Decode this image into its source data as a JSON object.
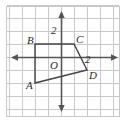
{
  "figure": {
    "kind": "coordinate-plane-quadrilateral",
    "width": 126,
    "height": 123,
    "background": "#ffffff",
    "border_color": "#c8c8c8",
    "grid_color": "#c9c9c9",
    "axis_color": "#555555",
    "shape_color": "#444444",
    "text_color": "#2b2b2b"
  },
  "grid": {
    "spacing_px": 13,
    "origin_px": {
      "x": 61,
      "y": 57
    },
    "x_cells": 9,
    "y_cells": 9,
    "visible": true
  },
  "axes": {
    "x_axis_label": "",
    "y_axis_label": "",
    "arrows": [
      "left",
      "right",
      "up",
      "down"
    ],
    "origin_label": "O",
    "tick_labels": [
      {
        "text": "2",
        "axis": "y",
        "value": 2,
        "px": {
          "x": 52,
          "y": 25
        }
      },
      {
        "text": "2",
        "axis": "x",
        "value": 2,
        "px": {
          "x": 85,
          "y": 54
        }
      }
    ]
  },
  "shape": {
    "name": "quadrilateral ABCD",
    "closed": true,
    "vertices": [
      {
        "label": "A",
        "x": -2,
        "y": -2,
        "px": {
          "x": 35,
          "y": 83
        },
        "label_px": {
          "x": 27,
          "y": 86
        }
      },
      {
        "label": "B",
        "x": -2,
        "y": 1,
        "px": {
          "x": 35,
          "y": 44
        },
        "label_px": {
          "x": 27,
          "y": 35
        }
      },
      {
        "label": "C",
        "x": 1,
        "y": 1,
        "px": {
          "x": 74,
          "y": 44
        },
        "label_px": {
          "x": 76,
          "y": 35
        }
      },
      {
        "label": "D",
        "x": 2,
        "y": -1,
        "px": {
          "x": 87,
          "y": 70
        },
        "label_px": {
          "x": 89,
          "y": 72
        }
      }
    ],
    "edges": [
      {
        "from": "A",
        "to": "B"
      },
      {
        "from": "B",
        "to": "C"
      },
      {
        "from": "C",
        "to": "D"
      },
      {
        "from": "D",
        "to": "A"
      }
    ]
  },
  "labels": {
    "A": "A",
    "B": "B",
    "C": "C",
    "D": "D",
    "O": "O",
    "two_y": "2",
    "two_x": "2"
  }
}
